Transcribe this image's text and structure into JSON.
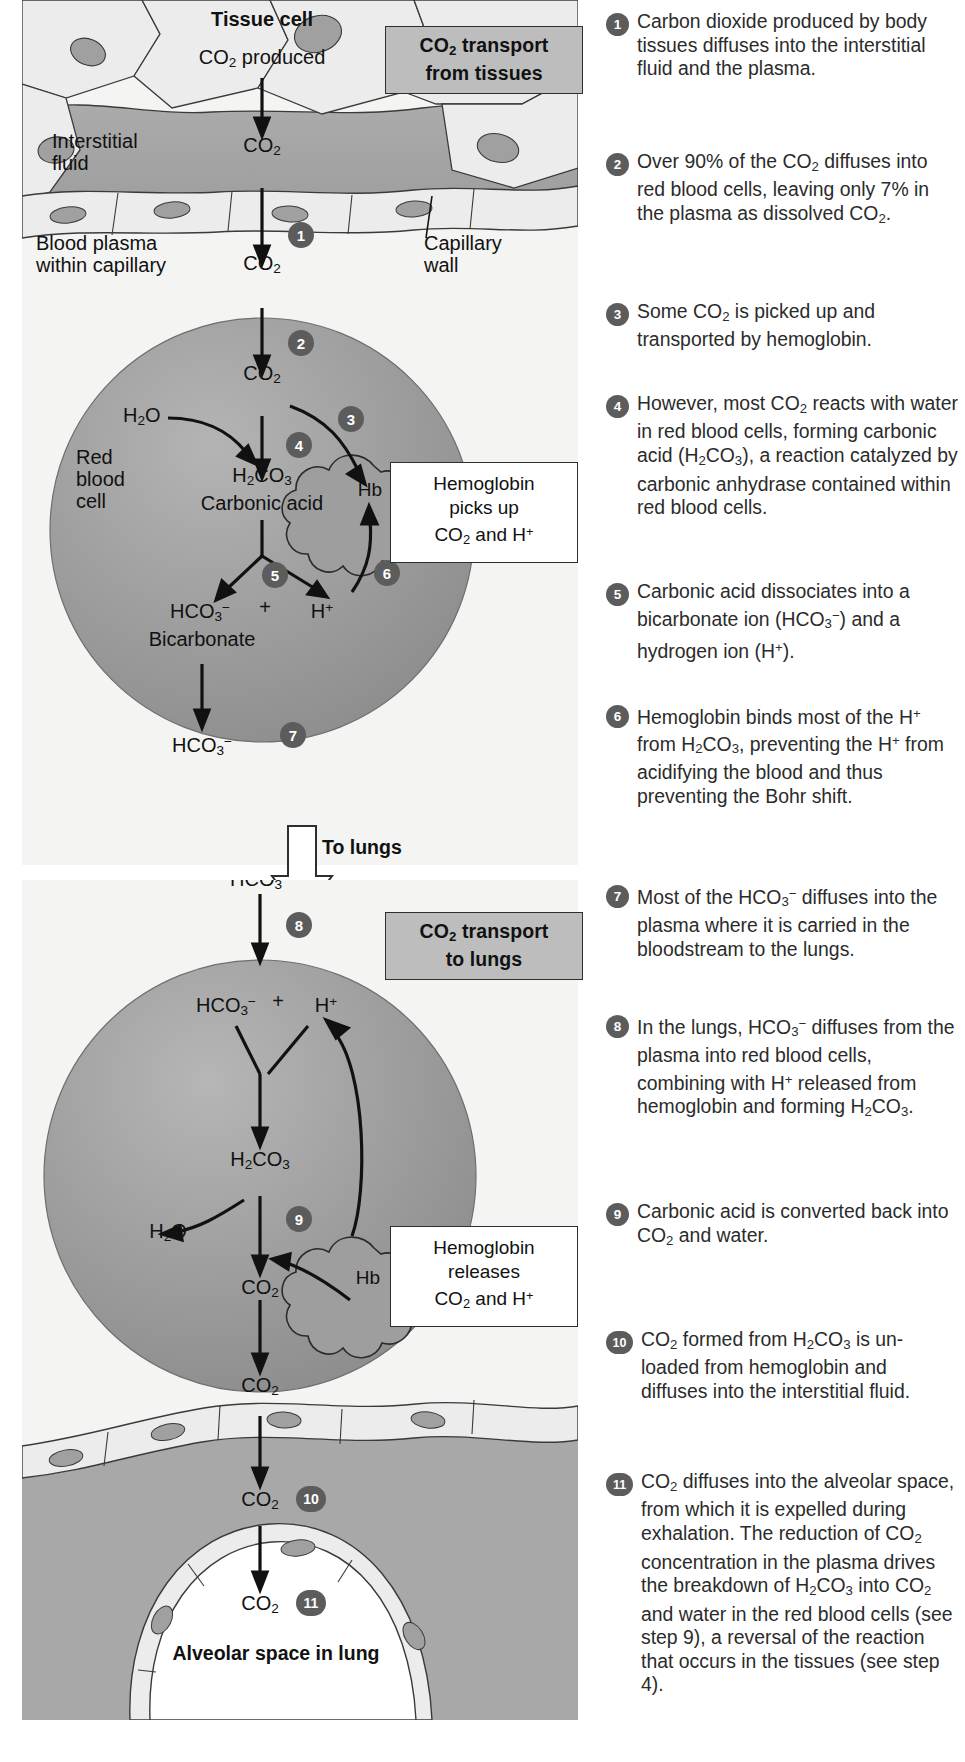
{
  "figure": {
    "domain_note": "Biology textbook diagram: carbon dioxide transport in the blood",
    "panels": [
      {
        "id": "tissues",
        "title": "CO₂ transport from tissues"
      },
      {
        "id": "lungs",
        "title": "CO₂ transport to lungs"
      }
    ],
    "transition_label": "To lungs"
  },
  "colors": {
    "panel_background": "#f4f4f2",
    "title_box_fill": "#bdbdbd",
    "title_box_border": "#2e2e2e",
    "badge_fill": "#5c5c5c",
    "badge_text": "#ffffff",
    "red_blood_cell": "#9a9a9a",
    "interstitial_fluid": "#a8a8a8",
    "cell_cytoplasm": "#ececec",
    "nucleus": "#a0a0a0",
    "callout_fill": "#ffffff",
    "arrow": "#111111",
    "body_text": "#2b2b2b"
  },
  "panel_tissues": {
    "title": "CO₂ transport from tissues",
    "labels": {
      "tissue_cell": "Tissue cell",
      "co2_produced": "CO₂ produced",
      "interstitial_fluid": "Interstitial fluid",
      "co2_in_fluid": "CO₂",
      "blood_plasma": "Blood plasma within capillary",
      "capillary_wall": "Capillary wall",
      "co2_in_plasma": "CO₂",
      "red_blood_cell": "Red blood cell",
      "co2_in_rbc": "CO₂",
      "water": "H₂O",
      "carbonic_acid_formula": "H₂CO₃",
      "carbonic_acid_name": "Carbonic acid",
      "hb": "Hb",
      "bicarbonate_formula": "HCO₃⁻",
      "plus": "+",
      "hydrogen_ion": "H⁺",
      "bicarbonate_name": "Bicarbonate",
      "bicarbonate_out": "HCO₃⁻"
    },
    "callout": "Hemoglobin picks up CO₂ and H⁺",
    "badges": [
      "1",
      "2",
      "3",
      "4",
      "5",
      "6",
      "7"
    ]
  },
  "panel_lungs": {
    "title": "CO₂ transport to lungs",
    "labels": {
      "bicarbonate_in": "HCO₃⁻",
      "bicarbonate_rbc": "HCO₃⁻",
      "plus": "+",
      "hydrogen_ion": "H⁺",
      "carbonic_acid_formula": "H₂CO₃",
      "hb": "Hb",
      "water": "H₂O",
      "co2_in_rbc": "CO₂",
      "co2_in_plasma": "CO₂",
      "co2_interstitial": "CO₂",
      "co2_alveolar": "CO₂",
      "alveolar_space": "Alveolar space in lung"
    },
    "callout": "Hemoglobin releases CO₂ and H⁺",
    "badges": [
      "8",
      "9",
      "10",
      "11"
    ]
  },
  "steps": [
    {
      "n": "1",
      "text": "Carbon dioxide produced by body tissues diffuses into the interstitial fluid and the plasma."
    },
    {
      "n": "2",
      "text": "Over 90% of the CO₂ diffuses into red blood cells, leaving only 7% in the plasma as dissolved CO₂."
    },
    {
      "n": "3",
      "text": "Some CO₂ is picked up and transported by hemoglobin."
    },
    {
      "n": "4",
      "text": "However, most CO₂ reacts with water in red blood cells, forming carbonic acid (H₂CO₃), a reaction catalyzed by carbonic anhydrase contained within red blood cells."
    },
    {
      "n": "5",
      "text": "Carbonic acid dissociates into a bicarbonate ion (HCO₃⁻) and a hydrogen ion (H⁺)."
    },
    {
      "n": "6",
      "text": "Hemoglobin binds most of the H⁺ from H₂CO₃, preventing the H⁺ from acidifying the blood and thus preventing the Bohr shift."
    },
    {
      "n": "7",
      "text": "Most of the HCO₃⁻ diffuses into the plasma where it is carried in the bloodstream to the lungs."
    },
    {
      "n": "8",
      "text": "In the lungs, HCO₃⁻ diffuses from the plasma into red blood cells, combining with H⁺ released from hemoglobin and forming H₂CO₃."
    },
    {
      "n": "9",
      "text": "Carbonic acid is converted back into CO₂ and water."
    },
    {
      "n": "10",
      "text": "CO₂ formed from H₂CO₃ is un-loaded from hemoglobin and diffuses into the interstitial fluid."
    },
    {
      "n": "11",
      "text": "CO₂ diffuses into the alveolar space, from which it is expelled during exhalation. The reduction of CO₂ concentration in the plasma drives the breakdown of H₂CO₃ into CO₂ and water in the red blood cells (see step 9), a reversal of the reaction that occurs in the tissues (see step 4)."
    }
  ]
}
